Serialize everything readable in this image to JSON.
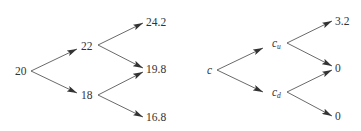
{
  "diagram": {
    "type": "binomial-tree",
    "colors": {
      "line": "#444444",
      "text": "#333333",
      "background": "#ffffff"
    },
    "trees": [
      {
        "id": "stock-price-tree",
        "nodes": {
          "root": {
            "text": "20"
          },
          "up": {
            "text": "22"
          },
          "down": {
            "text": "18"
          },
          "uu": {
            "text": "24.2"
          },
          "ud_from_up": {
            "text": "19.8"
          },
          "dd": {
            "text": "16.8"
          }
        },
        "edges": [
          {
            "from": "root",
            "to": "up"
          },
          {
            "from": "root",
            "to": "down"
          },
          {
            "from": "up",
            "to": "uu"
          },
          {
            "from": "up",
            "to": "ud_from_up"
          },
          {
            "from": "down",
            "to": "ud_from_up"
          },
          {
            "from": "down",
            "to": "dd"
          }
        ]
      },
      {
        "id": "option-value-tree",
        "nodes": {
          "root": {
            "text": "c"
          },
          "up": {
            "text": "c",
            "subscript": "u"
          },
          "down": {
            "text": "c",
            "subscript": "d"
          },
          "uu": {
            "text": "3.2"
          },
          "ud_from_up": {
            "text": "0"
          },
          "dd": {
            "text": "0"
          }
        },
        "edges": [
          {
            "from": "root",
            "to": "up"
          },
          {
            "from": "root",
            "to": "down"
          },
          {
            "from": "up",
            "to": "uu"
          },
          {
            "from": "up",
            "to": "ud_from_up"
          },
          {
            "from": "down",
            "to": "ud_from_up"
          },
          {
            "from": "down",
            "to": "dd"
          }
        ]
      }
    ]
  }
}
